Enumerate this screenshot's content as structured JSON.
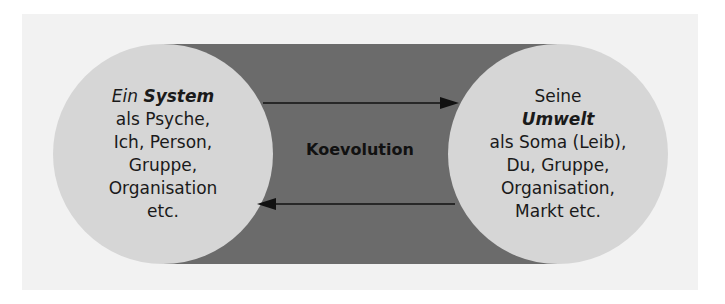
{
  "diagram": {
    "left_circle": {
      "line1_italic": "Ein",
      "line1_bold_italic": "System",
      "lines": [
        "als Psyche,",
        "Ich, Person,",
        "Gruppe,",
        "Organisation",
        "etc."
      ]
    },
    "right_circle": {
      "line1": "Seine",
      "line2_bold_italic": "Umwelt",
      "lines": [
        "als Soma (Leib),",
        "Du, Gruppe,",
        "Organisation,",
        "Markt etc."
      ]
    },
    "center_label": "Koevolution",
    "arrows": [
      {
        "direction": "left-to-right",
        "from": "System",
        "to": "Umwelt"
      },
      {
        "direction": "right-to-left",
        "from": "Umwelt",
        "to": "System"
      }
    ],
    "colors": {
      "panel_bg": "#f2f2f2",
      "band": "#6b6b6b",
      "circle": "#d6d6d6",
      "text": "#1a1a1a",
      "arrow": "#111111"
    }
  }
}
